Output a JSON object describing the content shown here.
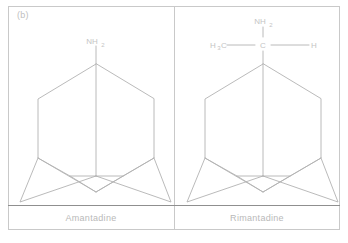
{
  "figure": {
    "panel_letter": "(b)",
    "background_color": "#ffffff",
    "frame_color": "#c9c9c9",
    "rule_color": "#8f8f8f",
    "bond_color": "#b0b0b0",
    "text_color": "#c4c4c4",
    "caption_color": "#b9b9b9"
  },
  "panels": [
    {
      "id": "amantadine",
      "caption": "Amantadine",
      "scaffold": "adamantane-cage",
      "substituent": {
        "type": "amine",
        "labels": [
          {
            "name": "nh2-label",
            "text": "NH",
            "sub": "2",
            "x": 88,
            "y": 34
          }
        ],
        "bonds": [
          {
            "name": "c1-n-bond",
            "x1": 88,
            "y1": 38,
            "x2": 88,
            "y2": 58
          }
        ]
      }
    },
    {
      "id": "rimantadine",
      "caption": "Rimantadine",
      "scaffold": "adamantane-cage",
      "substituent": {
        "type": "1-aminoethyl",
        "labels": [
          {
            "name": "h3c-label",
            "text": "H",
            "sub": "3",
            "text2": "C",
            "x": 40,
            "y": 40
          },
          {
            "name": "central-carbon-label",
            "text": "C",
            "x": 88,
            "y": 40
          },
          {
            "name": "h-label",
            "text": "H",
            "x": 136,
            "y": 40
          },
          {
            "name": "nh2-label",
            "text": "NH",
            "sub": "2",
            "x": 88,
            "y": 15
          }
        ],
        "bonds": [
          {
            "name": "h3c-c-bond",
            "x1": 52,
            "y1": 39,
            "x2": 80,
            "y2": 39
          },
          {
            "name": "c-h-bond",
            "x1": 96,
            "y1": 39,
            "x2": 130,
            "y2": 39
          },
          {
            "name": "c-n-bond",
            "x1": 88,
            "y1": 32,
            "x2": 88,
            "y2": 20
          },
          {
            "name": "c1-c-bond",
            "x1": 88,
            "y1": 46,
            "x2": 88,
            "y2": 58
          }
        ]
      }
    }
  ]
}
